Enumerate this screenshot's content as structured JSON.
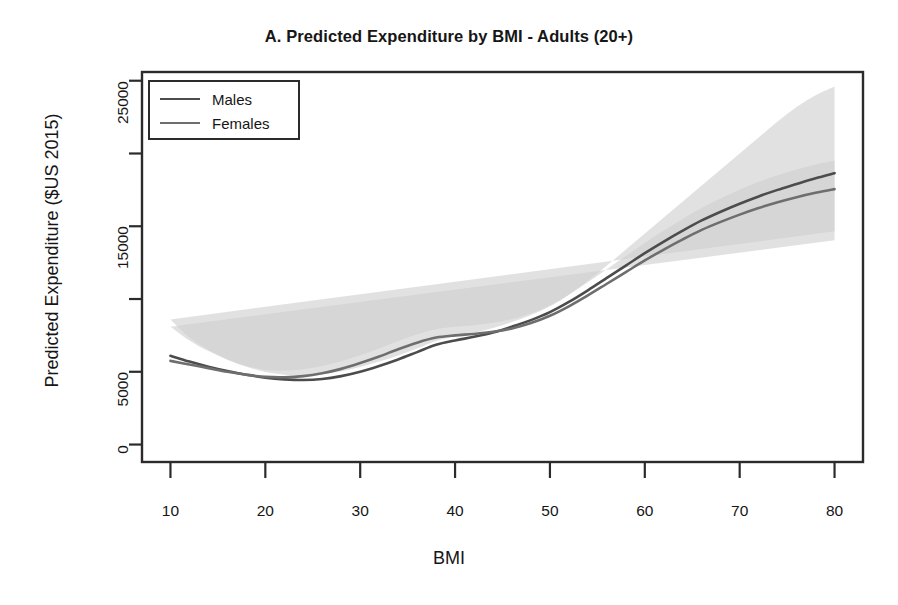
{
  "chart_data": {
    "type": "line",
    "title": "A. Predicted Expenditure by BMI - Adults (20+)",
    "xlabel": "BMI",
    "ylabel": "Predicted Expenditure ($US 2015)",
    "xlim": [
      7,
      83
    ],
    "ylim": [
      -1200,
      25600
    ],
    "grid": false,
    "legend_position": "top-left",
    "xticks": [
      10,
      20,
      30,
      40,
      50,
      60,
      70,
      80
    ],
    "xtick_labels": [
      "10",
      "20",
      "30",
      "40",
      "50",
      "60",
      "70",
      "80"
    ],
    "yticks": [
      0,
      5000,
      10000,
      15000,
      20000,
      25000
    ],
    "ytick_labels": [
      "0",
      "5000",
      "",
      "15000",
      "",
      "25000"
    ],
    "ytick_labels_shown": [
      "0",
      "5000",
      "15000",
      "25000"
    ],
    "x": [
      10,
      12,
      14,
      16,
      18,
      20,
      22,
      24,
      26,
      28,
      30,
      32,
      34,
      36,
      38,
      40,
      42,
      44,
      46,
      48,
      50,
      52,
      54,
      56,
      58,
      60,
      62,
      64,
      66,
      68,
      70,
      72,
      74,
      76,
      78,
      80
    ],
    "series": [
      {
        "name": "Males",
        "color": "#4c4c4c",
        "values": [
          6100,
          5700,
          5350,
          5050,
          4800,
          4600,
          4480,
          4430,
          4500,
          4700,
          5000,
          5400,
          5850,
          6350,
          6850,
          7150,
          7400,
          7700,
          8100,
          8550,
          9100,
          9800,
          10600,
          11450,
          12300,
          13150,
          13950,
          14700,
          15400,
          16000,
          16550,
          17050,
          17500,
          17900,
          18300,
          18650
        ],
        "band_lower": [
          4200,
          4250,
          4300,
          4330,
          4300,
          4250,
          4180,
          4120,
          4180,
          4380,
          4700,
          5120,
          5600,
          6120,
          6600,
          6900,
          7150,
          7450,
          7830,
          8270,
          8800,
          9420,
          10100,
          10800,
          11450,
          12050,
          12600,
          13100,
          13500,
          13800,
          14050,
          14250,
          14400,
          14500,
          14580,
          14650
        ],
        "band_upper": [
          8600,
          7350,
          6500,
          5850,
          5350,
          4980,
          4800,
          4760,
          4840,
          5040,
          5330,
          5700,
          6120,
          6600,
          7120,
          7420,
          7680,
          8000,
          8420,
          8900,
          9500,
          10300,
          11250,
          12300,
          13400,
          14500,
          15600,
          16700,
          17800,
          18900,
          20000,
          21100,
          22200,
          23200,
          24000,
          24600
        ]
      },
      {
        "name": "Females",
        "color": "#6e6e6e",
        "values": [
          5750,
          5500,
          5250,
          5000,
          4800,
          4650,
          4620,
          4700,
          4900,
          5200,
          5600,
          6050,
          6550,
          7000,
          7350,
          7500,
          7600,
          7750,
          7980,
          8350,
          8850,
          9500,
          10250,
          11050,
          11850,
          12650,
          13400,
          14100,
          14750,
          15300,
          15800,
          16250,
          16650,
          17000,
          17300,
          17550
        ],
        "band_lower": [
          3900,
          4000,
          4100,
          4150,
          4150,
          4100,
          4080,
          4150,
          4350,
          4650,
          5050,
          5500,
          6000,
          6450,
          6800,
          6950,
          7050,
          7200,
          7430,
          7800,
          8300,
          8900,
          9600,
          10300,
          11000,
          11650,
          12250,
          12750,
          13150,
          13450,
          13650,
          13800,
          13900,
          13950,
          14000,
          14030
        ],
        "band_upper": [
          8100,
          7150,
          6420,
          5830,
          5400,
          5130,
          5080,
          5180,
          5400,
          5720,
          6130,
          6600,
          7120,
          7580,
          7930,
          8090,
          8200,
          8370,
          8620,
          9020,
          9560,
          10300,
          11150,
          12050,
          12950,
          13850,
          14700,
          15500,
          16250,
          16900,
          17500,
          18050,
          18500,
          18900,
          19250,
          19500
        ]
      }
    ]
  },
  "legend": {
    "items": [
      {
        "label": "Males"
      },
      {
        "label": "Females"
      }
    ]
  },
  "colors": {
    "males_line": "#4c4c4c",
    "females_line": "#6e6e6e",
    "band": "#cfcfcf",
    "axis": "#2b2b2b",
    "text": "#161616",
    "background": "#ffffff"
  }
}
